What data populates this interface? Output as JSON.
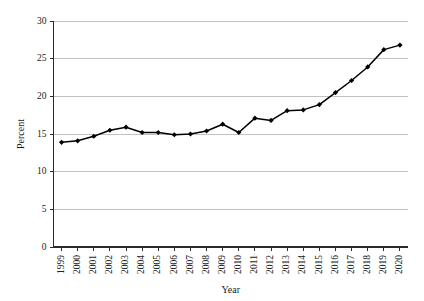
{
  "chart_data": {
    "type": "line",
    "title": "",
    "xlabel": "Year",
    "ylabel": "Percent",
    "categories": [
      "1999",
      "2000",
      "2001",
      "2002",
      "2003",
      "2004",
      "2005",
      "2006",
      "2007",
      "2008",
      "2009",
      "2010",
      "2011",
      "2012",
      "2013",
      "2014",
      "2015",
      "2016",
      "2017",
      "2018",
      "2019",
      "2020"
    ],
    "values": [
      13.9,
      14.1,
      14.7,
      15.5,
      15.9,
      15.2,
      15.2,
      14.9,
      15.0,
      15.4,
      16.3,
      15.2,
      17.1,
      16.8,
      18.1,
      18.2,
      18.9,
      20.5,
      22.1,
      23.9,
      26.2,
      26.8
    ],
    "series": [
      {
        "name": "Percent",
        "values": [
          13.9,
          14.1,
          14.7,
          15.5,
          15.9,
          15.2,
          15.2,
          14.9,
          15.0,
          15.4,
          16.3,
          15.2,
          17.1,
          16.8,
          18.1,
          18.2,
          18.9,
          20.5,
          22.1,
          23.9,
          26.2,
          26.8
        ]
      }
    ],
    "ylim": [
      0,
      30
    ],
    "yticks": [
      0,
      5,
      10,
      15,
      20,
      25,
      30
    ],
    "ytick_labels": [
      "0",
      "5",
      "10",
      "15",
      "20",
      "25",
      "30"
    ],
    "grid": true,
    "grid_axis": "y",
    "legend": false,
    "legend_position": "none",
    "marker": "diamond",
    "line_color": "#000000",
    "marker_color": "#000000",
    "grid_color": "#a8a8a8",
    "axis_color": "#2b2b2b",
    "background_color": "#ffffff"
  }
}
